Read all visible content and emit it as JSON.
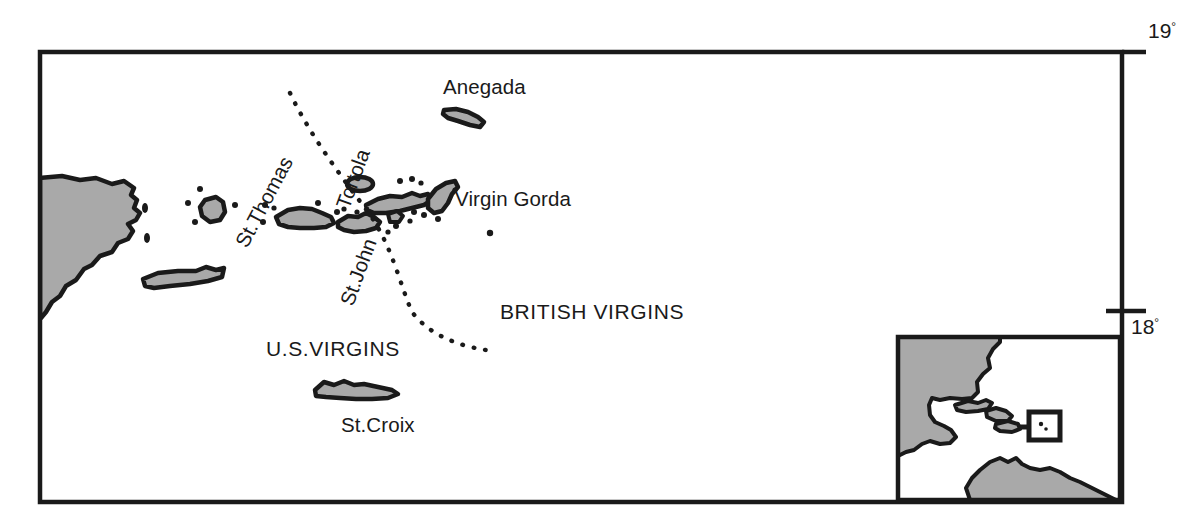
{
  "map": {
    "title": "Virgin Islands locator map",
    "graticule": {
      "labels": [
        {
          "id": "lat-19",
          "value": "19",
          "degree_symbol": "°",
          "x": 1148,
          "y": 38,
          "tick_y": 52
        },
        {
          "id": "lat-18",
          "value": "18",
          "degree_symbol": "°",
          "x": 1131,
          "y": 334,
          "tick_y": 311
        }
      ]
    },
    "frame": {
      "x": 40,
      "y": 52,
      "width": 1082,
      "height": 450,
      "stroke": "#1a1a1a",
      "stroke_width": 4
    },
    "colors": {
      "land_fill": "#a9a9a9",
      "outline": "#1a1a1a",
      "background": "#ffffff",
      "text": "#1a1a1a"
    },
    "place_labels": [
      {
        "name": "anegada",
        "text": "Anegada",
        "x": 443,
        "y": 94,
        "rotation": 0,
        "anchor": "start"
      },
      {
        "name": "virgin-gorda",
        "text": "Virgin Gorda",
        "x": 455,
        "y": 206,
        "rotation": 0,
        "anchor": "start"
      },
      {
        "name": "st-thomas",
        "text": "St.Thomas",
        "x": 247,
        "y": 249,
        "rotation": -62,
        "anchor": "start"
      },
      {
        "name": "tortola",
        "text": "Tortola",
        "x": 349,
        "y": 210,
        "rotation": -70,
        "anchor": "start"
      },
      {
        "name": "st-john",
        "text": "St.John",
        "x": 353,
        "y": 307,
        "rotation": -70,
        "anchor": "start"
      },
      {
        "name": "st-croix",
        "text": "St.Croix",
        "x": 341,
        "y": 432,
        "rotation": 0,
        "anchor": "start"
      }
    ],
    "region_labels": [
      {
        "name": "british-virgins",
        "text": "BRITISH VIRGINS",
        "x": 500,
        "y": 319,
        "anchor": "start"
      },
      {
        "name": "us-virgins",
        "text": "U.S.VIRGINS",
        "x": 266,
        "y": 356,
        "anchor": "start"
      }
    ],
    "boundary": {
      "name": "territorial-boundary",
      "style": "dotted",
      "description": "Dotted maritime boundary between U.S. Virgin Islands and British Virgin Islands"
    },
    "inset": {
      "name": "caribbean-locator-inset",
      "frame": {
        "x": 896,
        "y": 335,
        "width": 226,
        "height": 167
      },
      "locator_box": {
        "x": 1029,
        "y": 412,
        "width": 31,
        "height": 28
      },
      "description": "Caribbean region locator showing Central America, Greater and Lesser Antilles"
    }
  }
}
